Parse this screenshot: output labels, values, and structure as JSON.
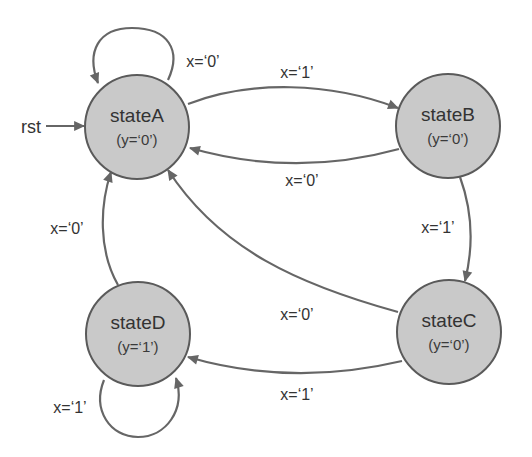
{
  "diagram": {
    "type": "state-machine",
    "colors": {
      "state_fill": "#c9c9c9",
      "state_stroke": "#5a5a5a",
      "edge": "#666666",
      "text": "#333333"
    },
    "reset": {
      "label": "rst",
      "target": "stateA"
    },
    "states": [
      {
        "id": "stateA",
        "name": "stateA",
        "output": "(y=‘0’)"
      },
      {
        "id": "stateB",
        "name": "stateB",
        "output": "(y=‘0’)"
      },
      {
        "id": "stateC",
        "name": "stateC",
        "output": "(y=‘0’)"
      },
      {
        "id": "stateD",
        "name": "stateD",
        "output": "(y=‘1’)"
      }
    ],
    "transitions": [
      {
        "from": "stateA",
        "to": "stateA",
        "label": "x=‘0’"
      },
      {
        "from": "stateA",
        "to": "stateB",
        "label": "x=‘1’"
      },
      {
        "from": "stateB",
        "to": "stateA",
        "label": "x=‘0’"
      },
      {
        "from": "stateB",
        "to": "stateC",
        "label": "x=‘1’"
      },
      {
        "from": "stateC",
        "to": "stateA",
        "label": "x=‘0’"
      },
      {
        "from": "stateC",
        "to": "stateD",
        "label": "x=‘1’"
      },
      {
        "from": "stateD",
        "to": "stateA",
        "label": "x=‘0’"
      },
      {
        "from": "stateD",
        "to": "stateD",
        "label": "x=‘1’"
      }
    ]
  }
}
